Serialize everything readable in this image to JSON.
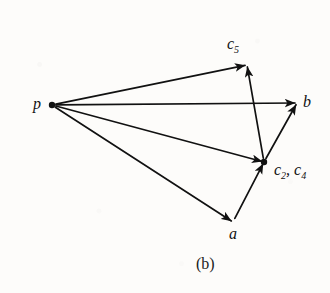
{
  "figure": {
    "caption": "(b)",
    "background_color": "#fdfcfa",
    "ink_color": "#111111"
  },
  "nodes": [
    {
      "id": "p",
      "label": "p",
      "sub": "",
      "label2": "",
      "sub2": "",
      "x": 52,
      "y": 105,
      "dot": true,
      "label_x": 33,
      "label_y": 96
    },
    {
      "id": "c5",
      "label": "c",
      "sub": "5",
      "label2": "",
      "sub2": "",
      "x": 247,
      "y": 65,
      "dot": false,
      "label_x": 227,
      "label_y": 36
    },
    {
      "id": "b",
      "label": "b",
      "sub": "",
      "label2": "",
      "sub2": "",
      "x": 297,
      "y": 103,
      "dot": false,
      "label_x": 303,
      "label_y": 94
    },
    {
      "id": "c2c4",
      "label": "c",
      "sub": "2",
      "label2": ", c",
      "sub2": "4",
      "x": 264,
      "y": 162,
      "dot": true,
      "label_x": 274,
      "label_y": 162
    },
    {
      "id": "a",
      "label": "a",
      "sub": "",
      "label2": "",
      "sub2": "",
      "x": 233,
      "y": 222,
      "dot": false,
      "label_x": 229,
      "label_y": 226
    }
  ],
  "edges": [
    {
      "from": "p",
      "to": "c5",
      "name": "edge-p-to-c5"
    },
    {
      "from": "p",
      "to": "b",
      "name": "edge-p-to-b"
    },
    {
      "from": "p",
      "to": "c2c4",
      "name": "edge-p-to-c2c4"
    },
    {
      "from": "p",
      "to": "a",
      "name": "edge-p-to-a"
    },
    {
      "from": "c2c4",
      "to": "c5",
      "name": "edge-c2c4-to-c5"
    },
    {
      "from": "c2c4",
      "to": "b",
      "name": "edge-c2c4-to-b"
    },
    {
      "from": "a",
      "to": "c2c4",
      "name": "edge-a-to-c2c4"
    }
  ]
}
